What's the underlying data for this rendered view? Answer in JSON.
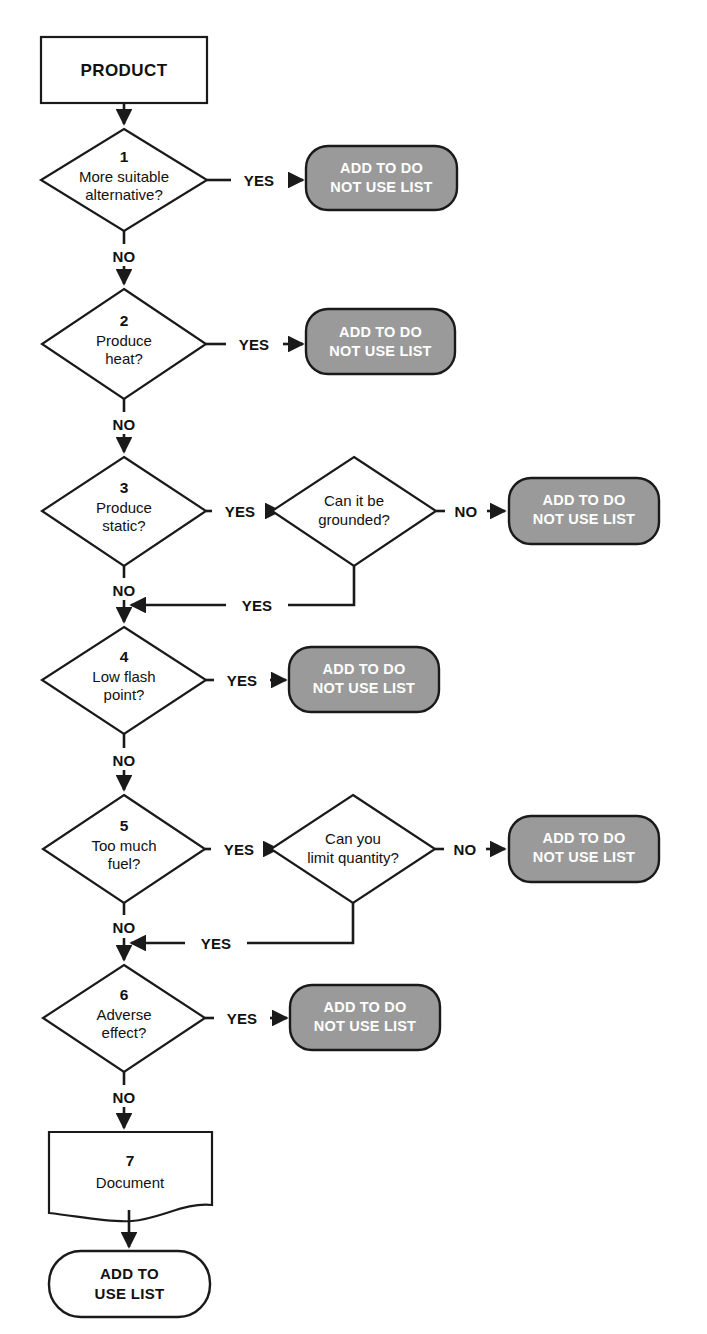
{
  "diagram": {
    "type": "flowchart",
    "colors": {
      "terminal_reject_fill": "#9a9a9a",
      "terminal_reject_text": "#ffffff",
      "terminal_accept_fill": "#ffffff",
      "terminal_accept_text": "#111111",
      "line": "#1a1a1a",
      "shape_fill": "#ffffff",
      "page_background": "#ffffff"
    },
    "start": {
      "label": "PRODUCT",
      "shape": "rectangle"
    },
    "steps": [
      {
        "number": "1",
        "question_line1": "More suitable",
        "question_line2": "alternative?",
        "yes_label": "YES",
        "no_label": "NO",
        "yes_target": "ADD TO DO NOT USE LIST",
        "shape": "diamond"
      },
      {
        "number": "2",
        "question_line1": "Produce",
        "question_line2": "heat?",
        "yes_label": "YES",
        "no_label": "NO",
        "yes_target": "ADD TO DO NOT USE LIST",
        "shape": "diamond"
      },
      {
        "number": "3",
        "question_line1": "Produce",
        "question_line2": "static?",
        "yes_label": "YES",
        "no_label": "NO",
        "shape": "diamond",
        "sub": {
          "question_line1": "Can it be",
          "question_line2": "grounded?",
          "no_label": "NO",
          "yes_label": "YES",
          "no_target": "ADD TO DO NOT USE LIST",
          "yes_target": "continue to next step",
          "shape": "diamond"
        }
      },
      {
        "number": "4",
        "question_line1": "Low flash",
        "question_line2": "point?",
        "yes_label": "YES",
        "no_label": "NO",
        "yes_target": "ADD TO DO NOT USE LIST",
        "shape": "diamond"
      },
      {
        "number": "5",
        "question_line1": "Too much",
        "question_line2": "fuel?",
        "yes_label": "YES",
        "no_label": "NO",
        "shape": "diamond",
        "sub": {
          "question_line1": "Can you",
          "question_line2": "limit quantity?",
          "no_label": "NO",
          "yes_label": "YES",
          "no_target": "ADD TO DO NOT USE LIST",
          "yes_target": "continue to next step",
          "shape": "diamond"
        }
      },
      {
        "number": "6",
        "question_line1": "Adverse",
        "question_line2": "effect?",
        "yes_label": "YES",
        "no_label": "NO",
        "yes_target": "ADD TO DO NOT USE LIST",
        "shape": "diamond"
      },
      {
        "number": "7",
        "label": "Document",
        "shape": "document"
      }
    ],
    "reject_terminals": [
      {
        "line1": "ADD TO DO",
        "line2": "NOT USE LIST"
      },
      {
        "line1": "ADD TO DO",
        "line2": "NOT USE LIST"
      },
      {
        "line1": "ADD TO DO",
        "line2": "NOT USE LIST"
      },
      {
        "line1": "ADD TO DO",
        "line2": "NOT USE LIST"
      },
      {
        "line1": "ADD TO DO",
        "line2": "NOT USE LIST"
      },
      {
        "line1": "ADD TO DO",
        "line2": "NOT USE LIST"
      }
    ],
    "accept_terminal": {
      "line1": "ADD TO",
      "line2": "USE LIST"
    }
  }
}
